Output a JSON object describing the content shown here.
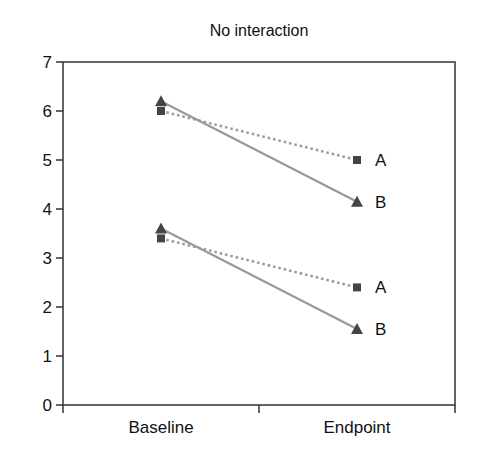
{
  "chart_data": {
    "type": "line",
    "title": "No interaction",
    "xlabel": "",
    "ylabel": "",
    "categories": [
      "Baseline",
      "Endpoint"
    ],
    "ylim": [
      0,
      7
    ],
    "yticks": [
      0,
      1,
      2,
      3,
      4,
      5,
      6,
      7
    ],
    "grid": false,
    "legend": "inline labels at endpoint",
    "series": [
      {
        "name": "A",
        "group": "upper",
        "marker": "square",
        "line": "dotted",
        "values": [
          6.0,
          5.0
        ]
      },
      {
        "name": "B",
        "group": "upper",
        "marker": "triangle",
        "line": "solid",
        "values": [
          6.2,
          4.15
        ]
      },
      {
        "name": "A",
        "group": "lower",
        "marker": "square",
        "line": "dotted",
        "values": [
          3.4,
          2.4
        ]
      },
      {
        "name": "B",
        "group": "lower",
        "marker": "triangle",
        "line": "solid",
        "values": [
          3.6,
          1.55
        ]
      }
    ],
    "colors": {
      "axis": "#333333",
      "line": "#999999",
      "marker": "#444444",
      "text": "#111111"
    }
  }
}
